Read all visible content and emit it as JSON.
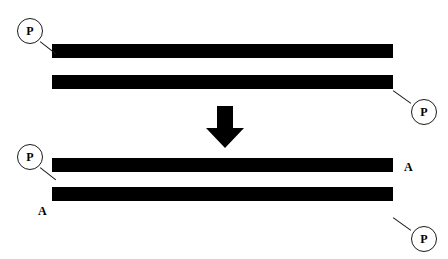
{
  "figure": {
    "title": "",
    "background_color": "#ffffff",
    "stroke_color": "#000000",
    "bar_color": "#000000"
  },
  "top_panel": {
    "bars": [
      {
        "name": "top-strand-upper",
        "x": 52,
        "y": 44,
        "width": 341,
        "height": 14
      },
      {
        "name": "top-strand-lower",
        "x": 52,
        "y": 75,
        "width": 341,
        "height": 14
      }
    ],
    "callouts": [
      {
        "id": "top-left-p",
        "label": "P",
        "cx": 30,
        "cy": 31
      },
      {
        "id": "top-right-p",
        "label": "P",
        "cx": 424,
        "cy": 112
      }
    ]
  },
  "arrow": {
    "name": "downward-arrow",
    "label": "",
    "x": 205,
    "y": 106,
    "width": 40,
    "height": 42
  },
  "bottom_panel": {
    "bars": [
      {
        "name": "bottom-strand-upper",
        "x": 52,
        "y": 158,
        "width": 341,
        "height": 14
      },
      {
        "name": "bottom-strand-lower",
        "x": 52,
        "y": 187,
        "width": 341,
        "height": 14
      }
    ],
    "callouts": [
      {
        "id": "bottom-left-p",
        "label": "P",
        "cx": 30,
        "cy": 157
      },
      {
        "id": "bottom-right-p",
        "label": "P",
        "cx": 424,
        "cy": 239
      }
    ],
    "labels": [
      {
        "id": "bottom-right-a",
        "label": "A",
        "x": 404,
        "y": 161
      },
      {
        "id": "bottom-left-a",
        "label": "A",
        "x": 38,
        "y": 205
      }
    ]
  },
  "footer": {
    "caption": ""
  }
}
